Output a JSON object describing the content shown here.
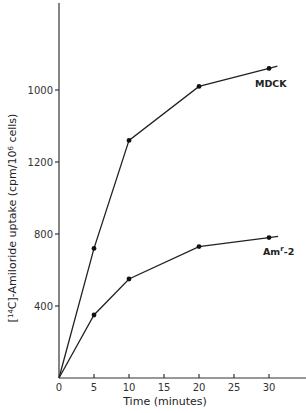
{
  "chart_data": {
    "type": "line",
    "title": "",
    "xlabel": "Time (minutes)",
    "ylabel": "[14C]-Amiloride uptake (cpm/10^6 cells)",
    "ylabel_parts": {
      "open": "[",
      "iso": "14",
      "elem": "C",
      "rest": "]-Amiloride uptake (cpm/10",
      "exp": "6",
      "tail": " cells)"
    },
    "x": [
      0,
      5,
      10,
      20,
      30
    ],
    "xlim": [
      0,
      35
    ],
    "ylim": [
      0,
      2060
    ],
    "x_ticks": [
      0,
      5,
      10,
      15,
      20,
      25,
      30
    ],
    "x_tick_labels": [
      "0",
      "5",
      "10",
      "15",
      "20",
      "25",
      "30"
    ],
    "y_ticks": [
      400,
      800,
      1200,
      1600
    ],
    "y_tick_labels": [
      "400",
      "800",
      "1200",
      "1000"
    ],
    "grid": false,
    "legend": "inline labels at line ends",
    "series": [
      {
        "name": "MDCK",
        "label_main": "MDCK",
        "label_sup": "",
        "label_tail": "",
        "values": [
          0,
          720,
          1320,
          1620,
          1720
        ],
        "extend_to": 31.2
      },
      {
        "name": "Amr-2",
        "label_main": "Am",
        "label_sup": "r",
        "label_tail": "-2",
        "values": [
          0,
          350,
          550,
          730,
          780
        ],
        "extend_to": 31.3
      }
    ]
  }
}
